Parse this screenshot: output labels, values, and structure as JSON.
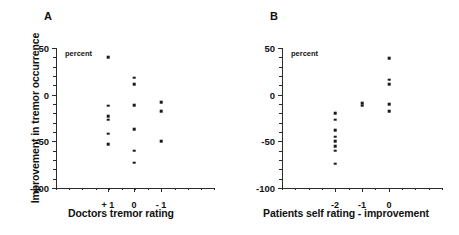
{
  "figure": {
    "y_axis_title": "Improvement in tremor occurrence",
    "units_annotation": "percent"
  },
  "chart_data": [
    {
      "type": "scatter",
      "panel": "A",
      "title": "",
      "xlabel": "Doctors tremor rating",
      "ylabel": "Improvement in tremor occurrence",
      "units": "percent",
      "categories": [
        "+ 1",
        "0",
        "- 1"
      ],
      "ylim": [
        -100,
        50
      ],
      "yticks": [
        50,
        0,
        -50,
        -100
      ],
      "ytick_labels": [
        "50",
        "0",
        "-50",
        "-100"
      ],
      "grid": false,
      "legend": "none",
      "points": [
        {
          "category": "+ 1",
          "values": [
            40,
            -12,
            -23,
            -27,
            -42,
            -53
          ]
        },
        {
          "category": "0",
          "values": [
            18,
            11,
            -11,
            -37,
            -60,
            -73
          ]
        },
        {
          "category": "- 1",
          "values": [
            -8,
            -18,
            -50
          ]
        }
      ]
    },
    {
      "type": "scatter",
      "panel": "B",
      "title": "",
      "xlabel": "Patients self rating - improvement",
      "ylabel": "Improvement in tremor occurrence",
      "units": "percent",
      "categories": [
        "-2",
        "-1",
        "0"
      ],
      "ylim": [
        -100,
        50
      ],
      "yticks": [
        50,
        0,
        -50,
        -100
      ],
      "ytick_labels": [
        "50",
        "0",
        "-50",
        "-100"
      ],
      "grid": false,
      "legend": "none",
      "points": [
        {
          "category": "-2",
          "values": [
            -20,
            -27,
            -38,
            -45,
            -50,
            -55,
            -60,
            -74
          ]
        },
        {
          "category": "-1",
          "values": [
            -9,
            -12
          ]
        },
        {
          "category": "0",
          "values": [
            39,
            16,
            11,
            -10,
            -18
          ]
        }
      ]
    }
  ],
  "panel_a": {
    "letter": "A",
    "units": "percent",
    "xtitle": "Doctors tremor rating",
    "ytick_labels": [
      "50",
      "0",
      "-50",
      "-100"
    ],
    "xtick_labels": [
      "+ 1",
      "0",
      "- 1"
    ]
  },
  "panel_b": {
    "letter": "B",
    "units": "percent",
    "xtitle": "Patients self rating - improvement",
    "ytick_labels": [
      "50",
      "0",
      "-50",
      "-100"
    ],
    "xtick_labels": [
      "-2",
      "-1",
      "0"
    ]
  }
}
